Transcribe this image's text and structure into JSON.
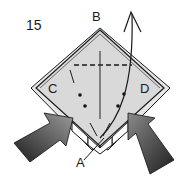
{
  "diagram": {
    "type": "origami-fold-step",
    "step_number": "15",
    "points": {
      "top": "B",
      "left": "C",
      "right": "D",
      "bottom": "A"
    },
    "colors": {
      "background": "#ffffff",
      "paper_fill": "#d9d9d9",
      "paper_edge": "#1a1a1a",
      "arrow_dark": "#2a2a2a",
      "arrow_light": "#8c8c8c"
    },
    "annotations": [
      {
        "kind": "valley-fold-line",
        "style": "dashed",
        "orientation": "horizontal"
      },
      {
        "kind": "crease",
        "style": "solid",
        "orientation": "vertical-center"
      },
      {
        "kind": "dots",
        "count": 4
      },
      {
        "kind": "arrow",
        "description": "point A lifted up and over"
      },
      {
        "kind": "push-arrows",
        "count": 2,
        "description": "squash sides C and D inward"
      }
    ]
  }
}
